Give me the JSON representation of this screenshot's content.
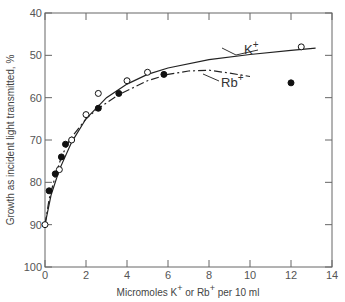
{
  "chart_data": {
    "type": "scatter",
    "title": "",
    "xlabel": "Micromoles K+ or Rb+ per 10 ml",
    "ylabel": "Growth as incident light transmitted, %",
    "xlim": [
      0,
      14
    ],
    "ylim": [
      100,
      40
    ],
    "y_inverted": true,
    "x_ticks": [
      0,
      2,
      4,
      6,
      8,
      10,
      12,
      14
    ],
    "y_ticks": [
      40,
      50,
      60,
      70,
      80,
      90,
      100
    ],
    "grid": false,
    "legend": "annotations",
    "series": [
      {
        "name": "K+",
        "marker": "open-circle",
        "line": "solid",
        "x": [
          0,
          0.7,
          1.3,
          2.0,
          2.6,
          4.0,
          5.0,
          12.5
        ],
        "y": [
          90,
          77,
          70,
          64,
          59,
          56,
          54,
          48
        ]
      },
      {
        "name": "Rb+",
        "marker": "filled-circle",
        "line": "dash-dot",
        "x": [
          0.2,
          0.5,
          0.8,
          1.0,
          2.6,
          3.6,
          5.8,
          12.0
        ],
        "y": [
          82,
          78,
          74,
          71,
          62.5,
          59,
          54.5,
          56.5
        ]
      }
    ],
    "annotations": [
      {
        "text": "K+",
        "points_to": "solid curve near x≈8.5"
      },
      {
        "text": "Rb+",
        "points_to": "dash-dot curve near x≈7.5"
      }
    ]
  },
  "labels": {
    "xlabel_main": "Micromoles K",
    "xlabel_mid": " or Rb",
    "xlabel_end": " per 10 ml",
    "sup": "+",
    "ylabel": "Growth as incident light transmitted, %",
    "k_label": "K",
    "rb_label": "Rb",
    "x_tick_labels": [
      "0",
      "2",
      "4",
      "6",
      "8",
      "10",
      "12",
      "14"
    ],
    "y_tick_labels": [
      "40",
      "50",
      "60",
      "70",
      "80",
      "90",
      "100"
    ]
  }
}
